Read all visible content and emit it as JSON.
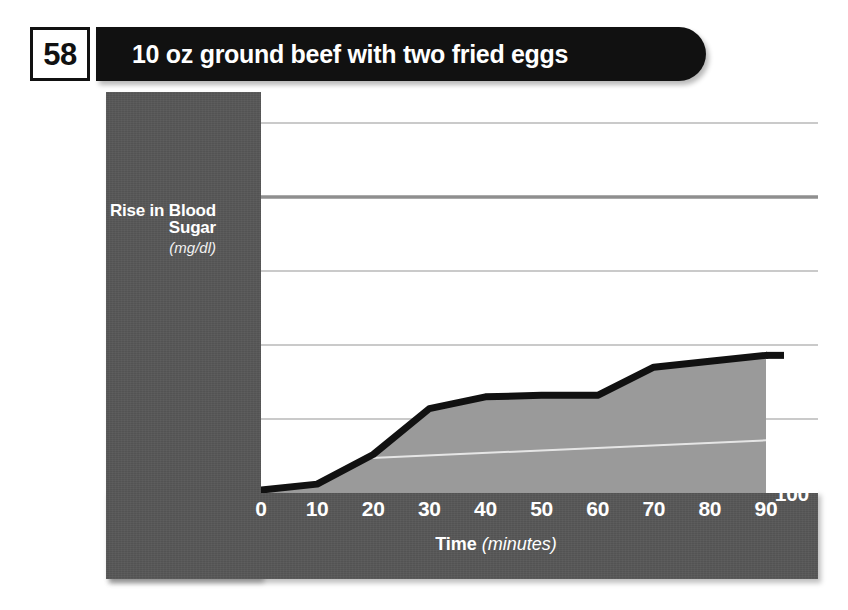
{
  "figure": {
    "number": "58",
    "title": "10 oz ground beef with two fried eggs"
  },
  "chart_data": {
    "type": "area",
    "title": "10 oz ground beef with two fried eggs",
    "xlabel": "Time",
    "xlabel_unit": "(minutes)",
    "ylabel": "Rise in Blood Sugar",
    "ylabel_unit": "(mg/dl)",
    "x": [
      0,
      10,
      20,
      30,
      40,
      50,
      60,
      70,
      80,
      90
    ],
    "values": [
      102,
      106,
      126,
      157,
      165,
      166,
      166,
      185,
      189,
      193
    ],
    "xlim": [
      0,
      90
    ],
    "ylim": [
      100,
      350
    ],
    "x_ticks": [
      "0",
      "10",
      "20",
      "30",
      "40",
      "50",
      "60",
      "70",
      "80",
      "90"
    ],
    "y_ticks": [
      "100",
      "150",
      "200",
      "250",
      "300",
      "350"
    ],
    "end_value_label": "193",
    "grid": true,
    "legend": "none",
    "colors": {
      "panel": "#575757",
      "header_bar": "#111111",
      "line": "#111111",
      "fill": "#9a9a9a",
      "gridline": "#b8b8b8",
      "gridline_emphasis": "#8f8f8f",
      "plot_background": "#ffffff",
      "tick_text": "#ffffff"
    }
  }
}
